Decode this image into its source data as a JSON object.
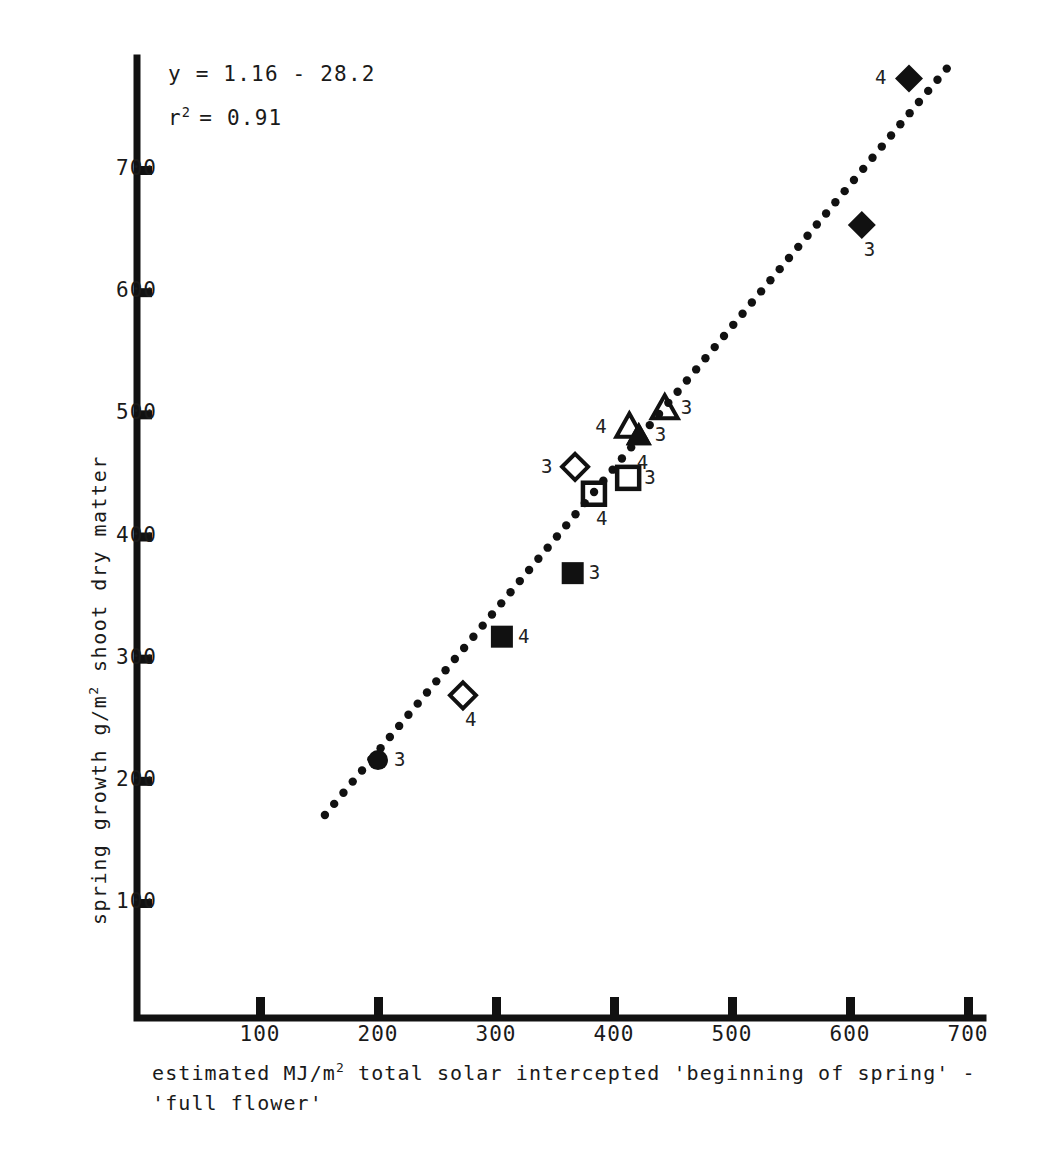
{
  "annotation": {
    "equation": "y = 1.16 - 28.2",
    "r_squared_prefix": "r",
    "r_squared_exp": "2",
    "r_squared_value": "= 0.91"
  },
  "axes": {
    "y_label_part1": "spring growth g/m",
    "y_label_exp": "2",
    "y_label_part2": " shoot dry matter",
    "x_label_line1_part1": "estimated MJ/m",
    "x_label_line1_exp": "2",
    "x_label_line1_part2": " total solar intercepted 'beginning of spring' -",
    "x_label_line2": "'full flower'",
    "y_ticks": [
      "700",
      "600",
      "500",
      "400",
      "300",
      "200",
      "100"
    ],
    "x_ticks": [
      "100",
      "200",
      "300",
      "400",
      "500",
      "600",
      "700"
    ]
  },
  "chart_data": {
    "type": "scatter",
    "title": "",
    "xlabel": "estimated MJ/m2 total solar intercepted 'beginning of spring' - 'full flower'",
    "ylabel": "spring growth g/m2 shoot dry matter",
    "xlim": [
      0,
      740
    ],
    "ylim": [
      0,
      800
    ],
    "grid": false,
    "legend": "none",
    "annotations": [
      "y = 1.16 - 28.2",
      "r2 = 0.91"
    ],
    "fit_line": {
      "style": "dotted",
      "x_start": 155,
      "y_start": 172,
      "x_end": 682,
      "y_end": 783
    },
    "points": [
      {
        "x": 200,
        "y": 217,
        "marker": "filled-circle",
        "label": "3",
        "label_side": "right"
      },
      {
        "x": 272,
        "y": 270,
        "marker": "open-diamond",
        "label": "4",
        "label_side": "below"
      },
      {
        "x": 305,
        "y": 318,
        "marker": "filled-square",
        "label": "4",
        "label_side": "right"
      },
      {
        "x": 365,
        "y": 370,
        "marker": "filled-square",
        "label": "3",
        "label_side": "right"
      },
      {
        "x": 383,
        "y": 435,
        "marker": "open-square",
        "label": "4",
        "label_side": "below"
      },
      {
        "x": 412,
        "y": 448,
        "marker": "open-square",
        "label": "3",
        "label_side": "right"
      },
      {
        "x": 367,
        "y": 457,
        "marker": "open-diamond",
        "label": "3",
        "label_side": "left"
      },
      {
        "x": 413,
        "y": 490,
        "marker": "open-triangle",
        "label": "4",
        "label_side": "left"
      },
      {
        "x": 443,
        "y": 505,
        "marker": "open-triangle",
        "label": "3",
        "label_side": "right"
      },
      {
        "x": 421,
        "y": 483,
        "marker": "filled-triangle",
        "label": "3",
        "label_side": "right"
      },
      {
        "x": 421,
        "y": 483,
        "marker": "filled-triangle",
        "label": "4",
        "label_side": "below"
      },
      {
        "x": 610,
        "y": 655,
        "marker": "filled-diamond",
        "label": "3",
        "label_side": "below"
      },
      {
        "x": 650,
        "y": 775,
        "marker": "filled-diamond",
        "label": "4",
        "label_side": "left"
      }
    ]
  }
}
